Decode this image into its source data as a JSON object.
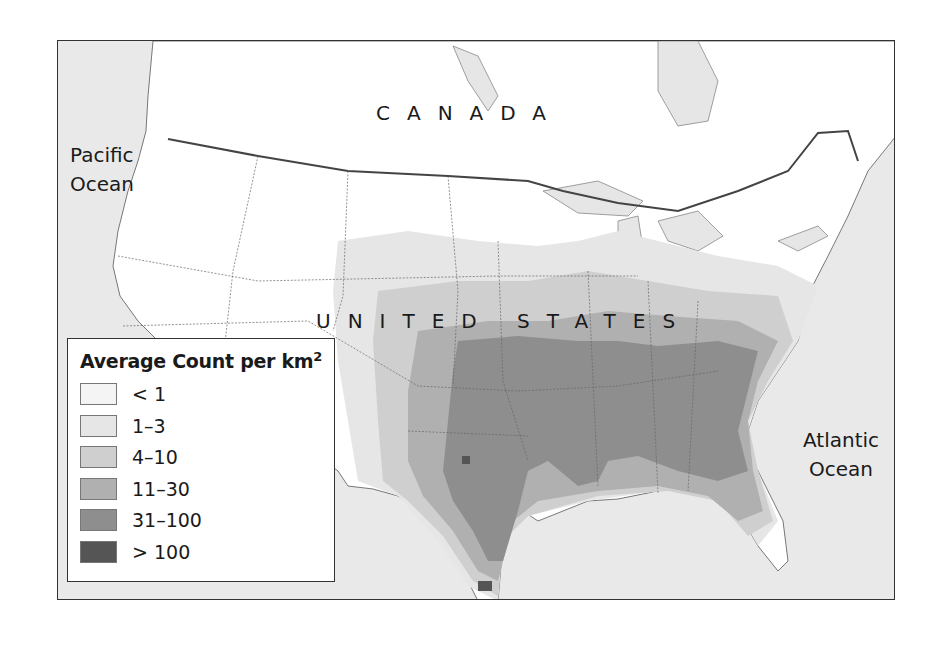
{
  "map": {
    "title": "Average Count per km²",
    "labels": {
      "country_north": "CANADA",
      "country_main": "UNITED STATES",
      "ocean_west_line1": "Pacific",
      "ocean_west_line2": "Ocean",
      "ocean_east_line1": "Atlantic",
      "ocean_east_line2": "Ocean"
    },
    "colors": {
      "ocean": "#e9e9e9",
      "land": "#ffffff",
      "border": "#555555",
      "lakes": "#e6e6e6"
    }
  },
  "legend": {
    "title_main": "Average Count per km",
    "title_sup": "2",
    "items": [
      {
        "label": "< 1",
        "color": "#f4f4f4"
      },
      {
        "label": "1–3",
        "color": "#e6e6e6"
      },
      {
        "label": "4–10",
        "color": "#cfcfcf"
      },
      {
        "label": "11–30",
        "color": "#b0b0b0"
      },
      {
        "label": "31–100",
        "color": "#8e8e8e"
      },
      {
        "label": "> 100",
        "color": "#555555"
      }
    ]
  }
}
